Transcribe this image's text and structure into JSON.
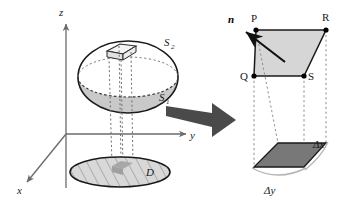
{
  "figure": {
    "width": 344,
    "height": 203,
    "background": "#ffffff"
  },
  "axes": {
    "z_label": "z",
    "y_label": "y",
    "x_label": "x",
    "axis_color": "#6b6b6b"
  },
  "left_panel": {
    "surface_upper_label": "S",
    "surface_upper_sub": "2",
    "surface_lower_label": "S",
    "surface_lower_sub": "1",
    "region_label": "D",
    "ellipsoid_top_fill": "#ffffff",
    "ellipsoid_bottom_fill": "#c9c9c9",
    "ellipsoid_stroke": "#1a1a1a",
    "patch_fill": "#f2f2f2",
    "region_fill": "#d0d0d0",
    "region_hatch_color": "#8a8a8a",
    "region_patch_fill": "#a8a8a8"
  },
  "arrow": {
    "name": "zoom-arrow",
    "color": "#4a4a4a"
  },
  "right_panel": {
    "vertex_p": "P",
    "vertex_r": "R",
    "vertex_q": "Q",
    "vertex_s": "S",
    "normal_label": "n",
    "delta_x_label": "Δx",
    "delta_y_label": "Δy",
    "top_face_fill": "#d6d6d6",
    "bottom_face_fill": "#787878",
    "edge_stroke": "#1a1a1a",
    "projection_line_color": "#9a9a9a",
    "brace_color": "#b0b0b0"
  }
}
